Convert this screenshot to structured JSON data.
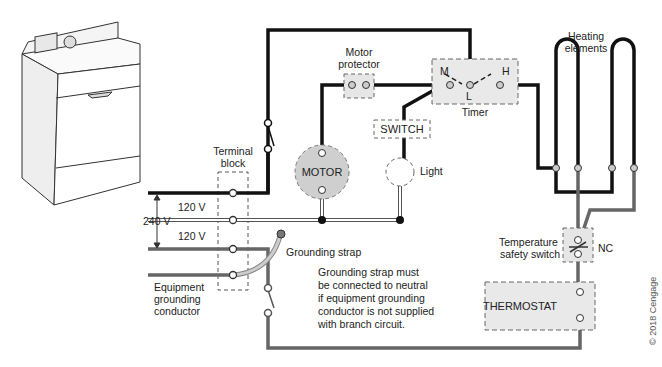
{
  "diagram": {
    "labels": {
      "terminal_block": [
        "Terminal",
        "block"
      ],
      "voltage_240": "240 V",
      "voltage_120_top": "120 V",
      "voltage_120_bottom": "120 V",
      "motor_protector": [
        "Motor",
        "protector"
      ],
      "timer": "Timer",
      "timer_m": "M",
      "timer_l": "L",
      "timer_h": "H",
      "switch": "SWITCH",
      "motor": "MOTOR",
      "light": "Light",
      "heating_elements": [
        "Heating",
        "elements"
      ],
      "temperature_safety_switch": [
        "Temperature",
        "safety switch"
      ],
      "nc": "NC",
      "thermostat": "THERMOSTAT",
      "grounding_strap": "Grounding strap",
      "equipment_grounding_conductor": [
        "Equipment",
        "grounding",
        "conductor"
      ],
      "note": [
        "Grounding strap must",
        "be connected to neutral",
        "if equipment grounding",
        "conductor is not supplied",
        "with branch circuit."
      ],
      "copyright": "© 2018 Cengage"
    },
    "colors": {
      "hot_wire": "#111111",
      "neutral_wire": "#ffffff",
      "ground_wire": "#666666",
      "component_fill": "#e6e6e6",
      "motor_fill": "#cfcfcf"
    }
  }
}
